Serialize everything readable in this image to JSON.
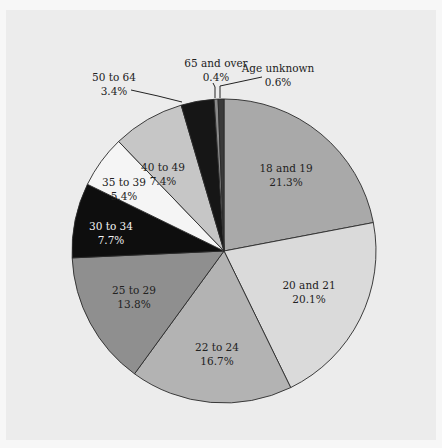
{
  "chart_data": {
    "type": "pie",
    "title": "",
    "start_angle_deg": 0,
    "direction": "clockwise",
    "center": [
      224,
      251
    ],
    "radius": 152,
    "slices": [
      {
        "label": "18 and 19",
        "value": 21.3,
        "value_label": "21.3%",
        "color": "#a9a9a9",
        "text_color": "#222222",
        "label_pos": [
          286,
          168
        ],
        "leader": null
      },
      {
        "label": "20 and 21",
        "value": 20.1,
        "value_label": "20.1%",
        "color": "#dadada",
        "text_color": "#222222",
        "label_pos": [
          309,
          285
        ],
        "leader": null
      },
      {
        "label": "22 to 24",
        "value": 16.7,
        "value_label": "16.7%",
        "color": "#b3b3b3",
        "text_color": "#222222",
        "label_pos": [
          217,
          347
        ],
        "leader": null
      },
      {
        "label": "25 to 29",
        "value": 13.8,
        "value_label": "13.8%",
        "color": "#8f8f8f",
        "text_color": "#222222",
        "label_pos": [
          134,
          290
        ],
        "leader": null
      },
      {
        "label": "30 to 34",
        "value": 7.7,
        "value_label": "7.7%",
        "color": "#0e0e0e",
        "text_color": "#f2f2f2",
        "label_pos": [
          111,
          226
        ],
        "leader": null
      },
      {
        "label": "35 to 39",
        "value": 5.4,
        "value_label": "5.4%",
        "color": "#f5f5f5",
        "text_color": "#222222",
        "label_pos": [
          124,
          182
        ],
        "leader": null
      },
      {
        "label": "40 to 49",
        "value": 7.4,
        "value_label": "7.4%",
        "color": "#c6c6c6",
        "text_color": "#222222",
        "label_pos": [
          163,
          167
        ],
        "leader": null
      },
      {
        "label": "50 to 64",
        "value": 3.4,
        "value_label": "3.4%",
        "color": "#161616",
        "text_color": "#222222",
        "label_pos": [
          114,
          77
        ],
        "leader": [
          [
            131,
            90
          ],
          [
            158,
            96
          ],
          [
            182,
            102
          ]
        ]
      },
      {
        "label": "65 and over",
        "value": 0.4,
        "value_label": "0.4%",
        "color": "#8a8a8a",
        "text_color": "#222222",
        "label_pos": [
          216,
          63
        ],
        "leader": [
          [
            213,
            83
          ],
          [
            215,
            87
          ],
          [
            215,
            98
          ]
        ]
      },
      {
        "label": "Age unknown",
        "value": 0.6,
        "value_label": "0.6%",
        "color": "#3a3a3a",
        "text_color": "#222222",
        "label_pos": [
          278,
          68
        ],
        "leader": [
          [
            262,
            77
          ],
          [
            220,
            86
          ],
          [
            220,
            98
          ]
        ]
      }
    ],
    "legend": null,
    "grid": false
  }
}
